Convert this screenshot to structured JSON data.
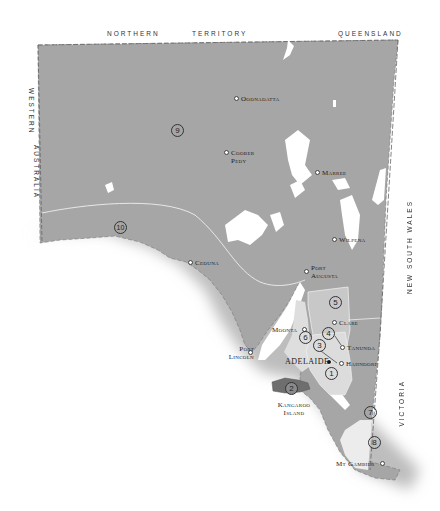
{
  "map": {
    "colors": {
      "land": "#a6a6a6",
      "wine_region_light": "#c8c8c8",
      "wine_region_lighter": "#dedede",
      "kangaroo_island": "#6e6e6e",
      "southeast": "#e9e9e9",
      "lakes": "#ffffff",
      "sea": "#ffffff",
      "border": "#666666"
    },
    "borders": {
      "north_1": "NORTHERN",
      "north_2": "TERRITORY",
      "north_3": "QUEENSLAND",
      "west_1": "WESTERN",
      "west_2": "AUSTRALIA",
      "east_1": "NEW SOUTH WALES",
      "east_2": "VICTORIA"
    },
    "towns": [
      {
        "name": "Oodnadatta"
      },
      {
        "name": "Coober Pedy"
      },
      {
        "name": "Marree"
      },
      {
        "name": "Wilpena"
      },
      {
        "name": "Ceduna"
      },
      {
        "name": "Port Augusta"
      },
      {
        "name": "Clare"
      },
      {
        "name": "Moonta"
      },
      {
        "name": "Tanunda"
      },
      {
        "name": "Hahndorf"
      },
      {
        "name": "Port Lincoln"
      },
      {
        "name": "Mt Gambier"
      }
    ],
    "capital": "ADELAIDE",
    "island": "Kangaroo Island",
    "regions": [
      "1",
      "2",
      "3",
      "4",
      "5",
      "6",
      "7",
      "8",
      "9",
      "10"
    ]
  }
}
